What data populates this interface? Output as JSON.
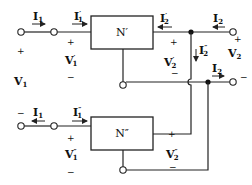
{
  "diagram": {
    "title": "",
    "networks": {
      "top": "N′",
      "bottom": "N″"
    },
    "labels": {
      "I1_top": {
        "main": "I",
        "sub": "1",
        "prime": ""
      },
      "I1p": {
        "main": "I",
        "sub": "1",
        "prime": "′"
      },
      "I2p": {
        "main": "I",
        "sub": "2",
        "prime": "′"
      },
      "I2_top": {
        "main": "I",
        "sub": "2",
        "prime": ""
      },
      "I2pp": {
        "main": "I",
        "sub": "2",
        "prime": "″"
      },
      "I2_mid": {
        "main": "I",
        "sub": "2",
        "prime": ""
      },
      "V2": {
        "main": "V",
        "sub": "2",
        "prime": ""
      },
      "V1": {
        "main": "V",
        "sub": "1",
        "prime": ""
      },
      "V1p": {
        "main": "V",
        "sub": "1",
        "prime": "′"
      },
      "V2p": {
        "main": "V",
        "sub": "2",
        "prime": "′"
      },
      "I1_bot": {
        "main": "I",
        "sub": "1",
        "prime": ""
      },
      "I1pp": {
        "main": "I",
        "sub": "1",
        "prime": "″"
      },
      "V1pp": {
        "main": "V",
        "sub": "1",
        "prime": "″"
      },
      "V2pp": {
        "main": "V",
        "sub": "2",
        "prime": "″"
      }
    },
    "signs": {
      "plus": "+",
      "minus": "−"
    }
  }
}
